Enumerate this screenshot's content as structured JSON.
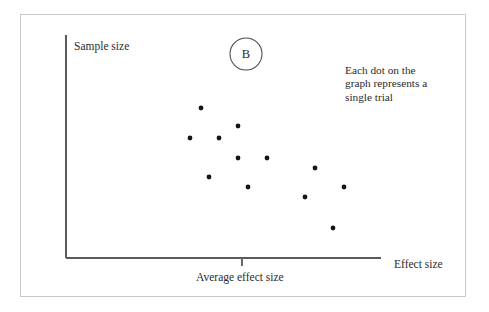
{
  "figure": {
    "panel_letter": "B",
    "annotation_lines": [
      "Each dot on the",
      "graph represents a",
      "single trial"
    ],
    "frame_color": "#c9c9c9",
    "axis_color": "#5a5a5a",
    "dot_color": "#151515",
    "text_color": "#2b2b2b",
    "background": "#ffffff"
  },
  "chart_data": {
    "type": "scatter",
    "title": "",
    "subtitle": "",
    "xlabel": "Effect size",
    "ylabel": "Sample size",
    "grid": false,
    "legend": false,
    "xlim": [
      0,
      100
    ],
    "ylim": [
      0,
      100
    ],
    "xticks": [],
    "yticks": [],
    "annotations": [
      {
        "text": "Each dot on the graph represents a single trial",
        "x": 88,
        "y": 88
      },
      {
        "text": "Average effect size",
        "x": 56,
        "y": -8
      },
      {
        "text": "B",
        "x": 57,
        "y": 96
      }
    ],
    "reference_line": {
      "label": "Average effect size",
      "axis": "x",
      "value": 56
    },
    "series": [
      {
        "name": "trials",
        "marker": "dot",
        "points": [
          {
            "x": 43,
            "y": 73
          },
          {
            "x": 40,
            "y": 59
          },
          {
            "x": 49,
            "y": 59
          },
          {
            "x": 55,
            "y": 64
          },
          {
            "x": 55,
            "y": 50
          },
          {
            "x": 64,
            "y": 50
          },
          {
            "x": 46,
            "y": 41
          },
          {
            "x": 58,
            "y": 36
          },
          {
            "x": 79,
            "y": 44
          },
          {
            "x": 88,
            "y": 36
          },
          {
            "x": 76,
            "y": 31
          },
          {
            "x": 85,
            "y": 17
          }
        ]
      }
    ],
    "point_count": 12
  },
  "geometry": {
    "dots_px": [
      {
        "cx": 201,
        "cy": 108
      },
      {
        "cx": 190,
        "cy": 138
      },
      {
        "cx": 219,
        "cy": 138
      },
      {
        "cx": 238,
        "cy": 126
      },
      {
        "cx": 238,
        "cy": 158
      },
      {
        "cx": 267,
        "cy": 158
      },
      {
        "cx": 209,
        "cy": 177
      },
      {
        "cx": 248,
        "cy": 187
      },
      {
        "cx": 315,
        "cy": 168
      },
      {
        "cx": 344,
        "cy": 187
      },
      {
        "cx": 305,
        "cy": 197
      },
      {
        "cx": 333,
        "cy": 228
      }
    ],
    "dot_radius": 2.4,
    "y_axis": {
      "x": 66,
      "y1": 35,
      "y2": 258
    },
    "x_axis": {
      "y": 258,
      "x1": 66,
      "x2": 381
    },
    "tick": {
      "x": 242,
      "y1": 258,
      "y2": 266
    },
    "circle": {
      "cx": 246,
      "cy": 54,
      "r": 16
    }
  }
}
